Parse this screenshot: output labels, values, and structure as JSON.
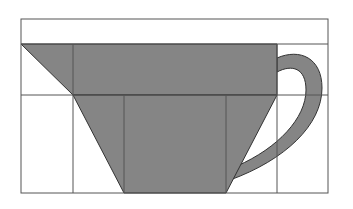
{
  "diagram": {
    "colors": {
      "background": "#ffffff",
      "fill": "#858585",
      "stroke": "#333333",
      "grid": "#555555"
    },
    "grid": {
      "outer": {
        "x": 21,
        "y": 19,
        "width": 307,
        "height": 174
      },
      "horizontal_lines_y": [
        44,
        95
      ],
      "vertical_lines_x": [
        73,
        124,
        226,
        277
      ]
    },
    "shapes": [
      {
        "name": "rim-band",
        "type": "polygon",
        "points": "21,44 277,44 277,95 73,95"
      },
      {
        "name": "body-trapezoid",
        "type": "polygon",
        "points": "73,95 277,95 226,193 124,193"
      },
      {
        "name": "handle",
        "type": "path"
      }
    ]
  }
}
